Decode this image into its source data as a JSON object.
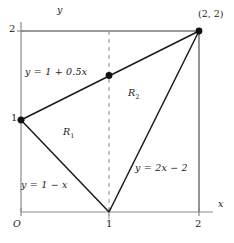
{
  "figure": {
    "type": "geometry-diagram",
    "axes": {
      "x_label": "x",
      "y_label": "y",
      "origin_label": "O",
      "x_ticks": [
        "1",
        "2"
      ],
      "y_ticks": [
        "1",
        "2"
      ],
      "x_range": [
        0,
        2
      ],
      "y_range": [
        0,
        2
      ]
    },
    "point_labels": [
      {
        "name": "corner-point",
        "text": "(2, 2)",
        "x": 2,
        "y": 2
      }
    ],
    "curve_labels": [
      {
        "name": "line-label-upper",
        "text": "y = 1 + 0.5x"
      },
      {
        "name": "line-label-lower-left",
        "text": "y = 1 − x"
      },
      {
        "name": "line-label-lower-right",
        "text": "y = 2x − 2"
      }
    ],
    "region_labels": [
      {
        "name": "region-r1",
        "base": "R",
        "sub": "1"
      },
      {
        "name": "region-r2",
        "base": "R",
        "sub": "2"
      }
    ],
    "marked_points": [
      {
        "name": "point-0-1",
        "x": 0,
        "y": 1
      },
      {
        "name": "point-1-1p5",
        "x": 1,
        "y": 1.5
      },
      {
        "name": "point-2-2",
        "x": 2,
        "y": 2
      }
    ],
    "colors": {
      "axis": "#8c8c8c",
      "border": "#7a7a7a",
      "line": "#1a1a1a",
      "dashed": "#a0a0a0",
      "text": "#1a1a1a"
    }
  }
}
